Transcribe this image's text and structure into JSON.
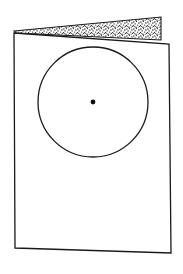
{
  "figure": {
    "caption": "",
    "background_color": "#ffffff",
    "ink_color": "#1a1a1a",
    "stipple_color": "#2b2b2b",
    "canvas": {
      "width": 183,
      "height": 274
    }
  },
  "sheet": {
    "name": "rectangular sheet",
    "stroke_color": "#1a1a1a",
    "fill_color": "#ffffff",
    "stroke_width": 1.3,
    "corners": {
      "top_left": [
        14,
        33
      ],
      "top_right": [
        169,
        44
      ],
      "bottom_right": [
        171,
        253
      ],
      "bottom_left": [
        15,
        248
      ]
    },
    "points": "14,33 169,44 171,253 15,248"
  },
  "circle": {
    "name": "inscribed circle",
    "center_x": 93,
    "center_y": 102,
    "radius": 55,
    "stroke_color": "#1a1a1a",
    "stroke_width": 1.3,
    "fill_color": "none"
  },
  "center_dot": {
    "name": "circle center point",
    "center_x": 93,
    "center_y": 102,
    "radius": 2.4,
    "fill_color": "#0d0d0d"
  },
  "flap": {
    "name": "stippled top flap",
    "description": "tapered wedge with dot stipple texture along the top edge of the sheet",
    "stroke_color": "#1a1a1a",
    "stroke_width": 1.1,
    "stipple_color": "#2b2b2b",
    "points": "14,31 161,17 161,40 16,33",
    "top_left": [
      14,
      31
    ],
    "top_right": [
      161,
      17
    ],
    "bottom_right": [
      161,
      40
    ],
    "bottom_left": [
      16,
      33
    ]
  }
}
